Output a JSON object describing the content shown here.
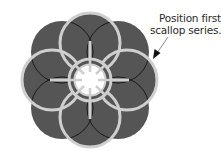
{
  "diagram": {
    "annotation": {
      "line1": "Position first",
      "line2": "scallop series."
    },
    "colors": {
      "fill": "#555555",
      "outline": "#cfcfcf",
      "seam": "#1a1a1a",
      "background": "#ffffff",
      "text": "#2a2a2a"
    }
  }
}
